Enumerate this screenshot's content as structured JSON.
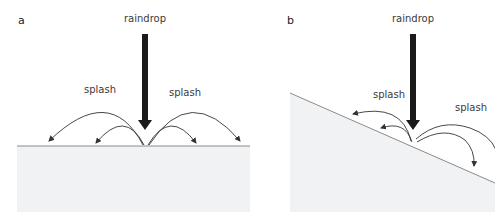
{
  "figure": {
    "panel_a": {
      "letter": "a",
      "arrow_label": "raindrop",
      "splash_left": "splash",
      "splash_right": "splash",
      "surface": "flat"
    },
    "panel_b": {
      "letter": "b",
      "arrow_label": "raindrop",
      "splash_left": "splash",
      "splash_right": "splash",
      "surface": "sloped"
    },
    "colors": {
      "ground_fill": "#f1f2f3",
      "surface_line": "#8a8a8a",
      "arrow": "#1a1a1a",
      "splash_curve": "#333333"
    }
  }
}
